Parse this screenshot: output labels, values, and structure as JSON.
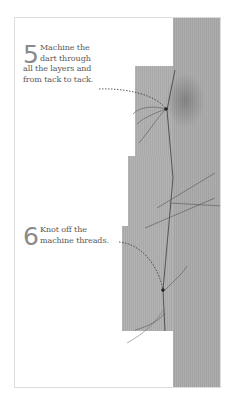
{
  "steps": [
    {
      "number": "5",
      "lines": [
        "Machine the",
        "dart through",
        "all the layers and",
        "from tack to tack."
      ]
    },
    {
      "number": "6",
      "lines": [
        "Knot off the",
        "machine threads."
      ]
    }
  ],
  "colors": {
    "fabric": "#a9a9a9",
    "text": "#5a5a5a",
    "step_number": "#8a8a8a",
    "frame_border": "#dcdcdc",
    "thread": "#4a4a4a"
  }
}
